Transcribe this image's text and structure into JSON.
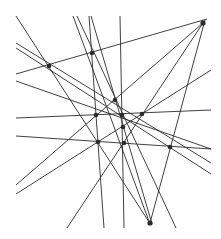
{
  "diagram": {
    "type": "line-arrangement",
    "width": 221,
    "height": 239,
    "line_color": "#2b2b2b",
    "point_color": "#2b2b2b",
    "points": [
      {
        "id": "P1",
        "x": 203,
        "y": 23
      },
      {
        "id": "P2",
        "x": 92,
        "y": 53
      },
      {
        "id": "P3",
        "x": 49,
        "y": 66
      },
      {
        "id": "P4",
        "x": 115,
        "y": 100
      },
      {
        "id": "P5",
        "x": 96,
        "y": 115
      },
      {
        "id": "P6",
        "x": 122,
        "y": 115
      },
      {
        "id": "P7",
        "x": 142,
        "y": 114
      },
      {
        "id": "P8",
        "x": 123,
        "y": 127
      },
      {
        "id": "P9",
        "x": 98,
        "y": 142
      },
      {
        "id": "P10",
        "x": 124,
        "y": 143
      },
      {
        "id": "P11",
        "x": 170,
        "y": 147
      },
      {
        "id": "P12",
        "x": 150,
        "y": 223
      }
    ],
    "lines": [
      {
        "x1": 16,
        "y1": 74,
        "x2": 207,
        "y2": 19
      },
      {
        "x1": 16,
        "y1": 16,
        "x2": 151,
        "y2": 225
      },
      {
        "x1": 16,
        "y1": 43,
        "x2": 211,
        "y2": 163
      },
      {
        "x1": 16,
        "y1": 48,
        "x2": 211,
        "y2": 174
      },
      {
        "x1": 16,
        "y1": 81,
        "x2": 211,
        "y2": 149
      },
      {
        "x1": 16,
        "y1": 118,
        "x2": 211,
        "y2": 110
      },
      {
        "x1": 16,
        "y1": 136,
        "x2": 211,
        "y2": 149
      },
      {
        "x1": 16,
        "y1": 185,
        "x2": 203,
        "y2": 23
      },
      {
        "x1": 16,
        "y1": 194,
        "x2": 211,
        "y2": 70
      },
      {
        "x1": 67,
        "y1": 228,
        "x2": 203,
        "y2": 23
      },
      {
        "x1": 150,
        "y1": 223,
        "x2": 205,
        "y2": 20
      },
      {
        "x1": 73,
        "y1": 16,
        "x2": 150,
        "y2": 224
      },
      {
        "x1": 77,
        "y1": 16,
        "x2": 176,
        "y2": 228
      },
      {
        "x1": 89,
        "y1": 16,
        "x2": 104,
        "y2": 228
      },
      {
        "x1": 91,
        "y1": 16,
        "x2": 152,
        "y2": 224
      },
      {
        "x1": 120,
        "y1": 16,
        "x2": 124,
        "y2": 228
      }
    ]
  }
}
